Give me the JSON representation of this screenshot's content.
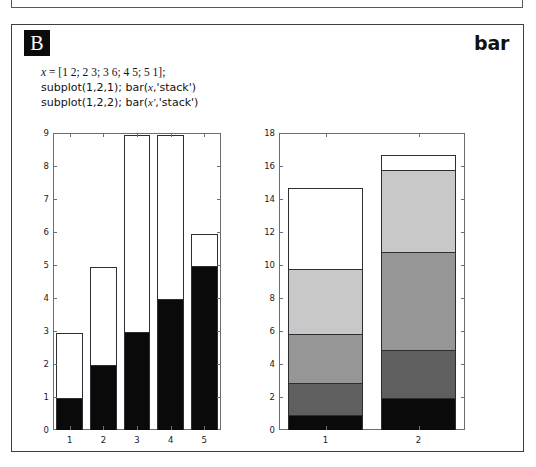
{
  "prev_fragment": {
    "text": "but this should show how it is displaying arguments."
  },
  "card": {
    "badge_label": "B",
    "function_title": "bar"
  },
  "code": {
    "lines": [
      "x = [1 2; 2 3; 3 6; 4 5; 5 1];",
      "subplot(1,2,1); bar(x,'stack')",
      "subplot(1,2,2); bar(x','stack')"
    ],
    "line1_var": "x",
    "line1_rest": " = [1  2; 2  3; 3  6; 4  5; 5  1];",
    "line2_a": "subplot(1,2,1); bar(",
    "line2_var": "x",
    "line2_b": ",'stack')",
    "line3_a": "subplot(1,2,2); bar(",
    "line3_var": "x'",
    "line3_b": ",'stack')"
  },
  "colors": {
    "series": [
      "#0a0a0a",
      "#5f5f5f",
      "#969696",
      "#c8c8c8",
      "#ffffff"
    ],
    "edge": "#2b2e32",
    "axis": "#6b6e73",
    "badge_bg": "#0b0b0b",
    "text": "#121212"
  },
  "chart_data": [
    {
      "type": "bar",
      "title": "",
      "subtitle": "subplot(1,2,1); bar(x,'stack')",
      "stacked": true,
      "xlabel": "",
      "ylabel": "",
      "categories": [
        "1",
        "2",
        "3",
        "4",
        "5"
      ],
      "xtick_labels": [
        "1",
        "2",
        "3",
        "4",
        "5"
      ],
      "ytick_labels": [
        "0",
        "1",
        "2",
        "3",
        "4",
        "5",
        "6",
        "7",
        "8",
        "9"
      ],
      "ylim": [
        0,
        9
      ],
      "ytick_step": 1,
      "grid": false,
      "legend": "none",
      "clipped_bars": [
        "3",
        "4"
      ],
      "series": [
        {
          "name": "column 1",
          "color": "#0a0a0a",
          "values": [
            1,
            2,
            3,
            4,
            5
          ]
        },
        {
          "name": "column 2",
          "color": "#ffffff",
          "values": [
            2,
            3,
            6,
            5,
            1
          ]
        }
      ],
      "cumulative_tops": [
        3,
        5,
        9,
        9,
        6
      ]
    },
    {
      "type": "bar",
      "title": "",
      "subtitle": "subplot(1,2,2); bar(x','stack')",
      "stacked": true,
      "xlabel": "",
      "ylabel": "",
      "categories": [
        "1",
        "2"
      ],
      "xtick_labels": [
        "1",
        "2"
      ],
      "ytick_labels": [
        "0",
        "2",
        "4",
        "6",
        "8",
        "10",
        "12",
        "14",
        "16",
        "18"
      ],
      "ylim": [
        0,
        18
      ],
      "ytick_step": 2,
      "grid": false,
      "legend": "none",
      "series": [
        {
          "name": "row 1",
          "color": "#0a0a0a",
          "values": [
            1,
            2
          ]
        },
        {
          "name": "row 2",
          "color": "#5f5f5f",
          "values": [
            2,
            3
          ]
        },
        {
          "name": "row 3",
          "color": "#969696",
          "values": [
            3,
            6
          ]
        },
        {
          "name": "row 4",
          "color": "#c8c8c8",
          "values": [
            4,
            5
          ]
        },
        {
          "name": "row 5",
          "color": "#ffffff",
          "values": [
            5,
            1
          ]
        }
      ],
      "cumulative_tops": [
        15,
        17
      ]
    }
  ]
}
